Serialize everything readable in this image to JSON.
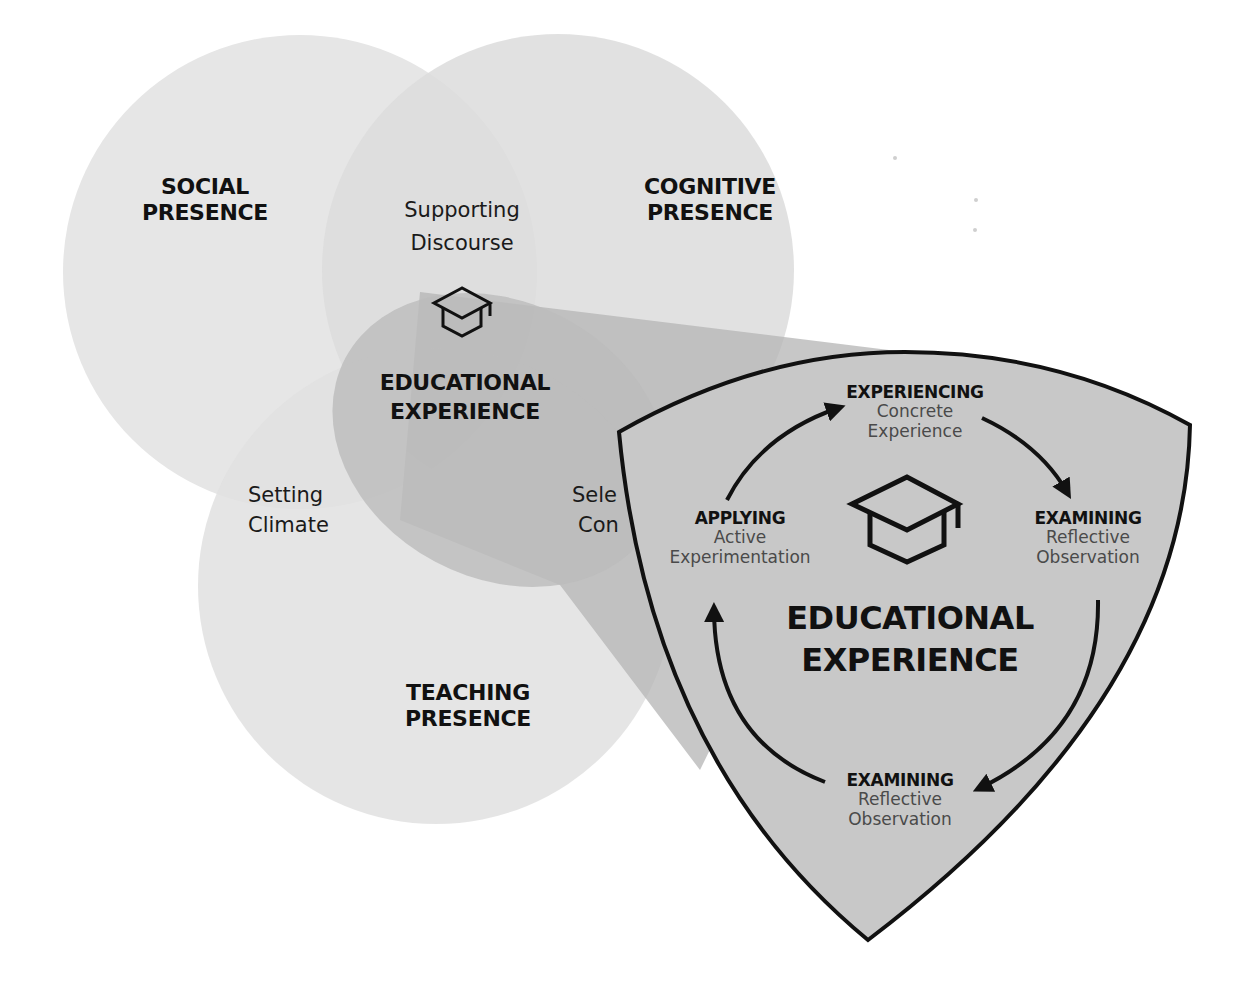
{
  "diagram": {
    "colors": {
      "background": "#ffffff",
      "circle_fill": "#d9d9d9",
      "lens_fill": "#b9b9b9",
      "cone_fill": "#b4b4b4",
      "shield_fill": "#c8c8c8",
      "outline": "#111111",
      "text_dark": "#111111",
      "text_muted": "#4a4a4a"
    },
    "circles": [
      {
        "name": "Social Presence",
        "title_line1": "SOCIAL",
        "title_line2": "PRESENCE"
      },
      {
        "name": "Cognitive Presence",
        "title_line1": "COGNITIVE",
        "title_line2": "PRESENCE"
      },
      {
        "name": "Teaching Presence",
        "title_line1": "TEACHING",
        "title_line2": "PRESENCE"
      }
    ],
    "overlaps": {
      "social_cognitive": {
        "line1": "Supporting",
        "line2": "Discourse"
      },
      "social_teaching": {
        "line1": "Setting",
        "line2": "Climate"
      },
      "cognitive_teaching": {
        "line1": "Sele",
        "line2": "Con"
      }
    },
    "center": {
      "icon": "graduation-cap-icon",
      "line1": "EDUCATIONAL",
      "line2": "EXPERIENCE"
    },
    "shield": {
      "icon": "graduation-cap-icon",
      "title_line1": "EDUCATIONAL",
      "title_line2": "EXPERIENCE",
      "stages": [
        {
          "position": "top",
          "title": "EXPERIENCING",
          "line1": "Concrete",
          "line2": "Experience"
        },
        {
          "position": "right",
          "title": "EXAMINING",
          "line1": "Reflective",
          "line2": "Observation"
        },
        {
          "position": "bottom",
          "title": "EXAMINING",
          "line1": "Reflective",
          "line2": "Observation"
        },
        {
          "position": "left",
          "title": "APPLYING",
          "line1": "Active",
          "line2": "Experimentation"
        }
      ],
      "cycle_arrows": [
        "left-to-top",
        "top-to-right",
        "right-to-bottom",
        "bottom-to-left"
      ]
    }
  }
}
